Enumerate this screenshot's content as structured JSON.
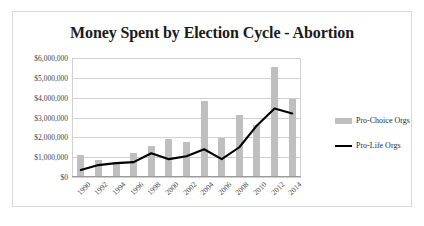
{
  "chart_data": {
    "type": "bar",
    "title": "Money Spent by Election Cycle - Abortion",
    "xlabel": "",
    "ylabel": "",
    "categories": [
      "1990",
      "1992",
      "1994",
      "1996",
      "1998",
      "2000",
      "2002",
      "2004",
      "2006",
      "2008",
      "2010",
      "2012",
      "2014"
    ],
    "series": [
      {
        "name": "Pro-Choice Orgs",
        "type": "bar",
        "color": "#bfbfbf",
        "values": [
          1050000,
          800000,
          700000,
          1150000,
          1500000,
          1850000,
          1700000,
          3800000,
          1900000,
          3100000,
          2550000,
          5500000,
          3900000
        ]
      },
      {
        "name": "Pro-Life Orgs",
        "type": "line",
        "color": "#000000",
        "values": [
          350000,
          600000,
          700000,
          750000,
          1200000,
          900000,
          1050000,
          1400000,
          900000,
          1500000,
          2600000,
          3450000,
          3200000
        ]
      }
    ],
    "ylim": [
      0,
      6000000
    ],
    "ytick_labels": [
      "$0",
      "$1,000,000",
      "$2,000,000",
      "$3,000,000",
      "$4,000,000",
      "$5,000,000",
      "$6,000,000"
    ],
    "ytick_values": [
      0,
      1000000,
      2000000,
      3000000,
      4000000,
      5000000,
      6000000
    ],
    "grid": true,
    "legend_position": "right"
  },
  "legend": {
    "items": [
      {
        "label": "Pro-Choice Orgs",
        "marker": "bar-swatch"
      },
      {
        "label": "Pro-Life Orgs",
        "marker": "line-swatch"
      }
    ]
  }
}
